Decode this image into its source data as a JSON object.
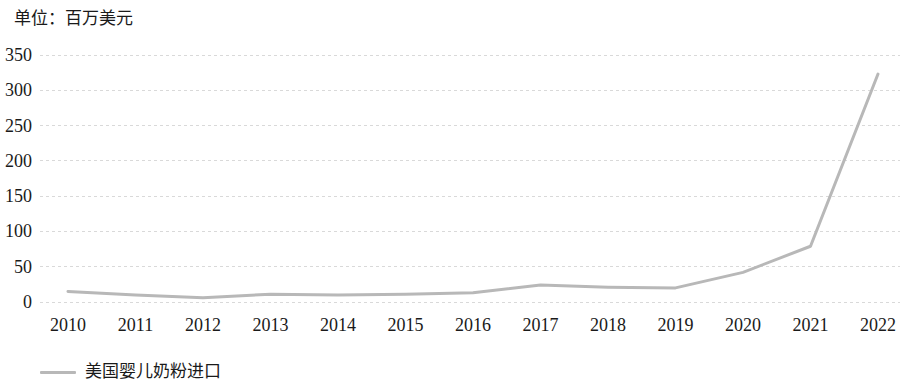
{
  "unit_label": "单位：百万美元",
  "legend": {
    "swatch_color": "#b8b8b8",
    "label": "美国婴儿奶粉进口"
  },
  "axis": {
    "y_ticks": [
      "0",
      "50",
      "100",
      "150",
      "200",
      "250",
      "300",
      "350"
    ],
    "x_ticks": [
      "2010",
      "2011",
      "2012",
      "2013",
      "2014",
      "2015",
      "2016",
      "2017",
      "2018",
      "2019",
      "2020",
      "2021",
      "2022"
    ]
  },
  "chart_data": {
    "type": "line",
    "title": "单位：百万美元",
    "xlabel": "",
    "ylabel": "百万美元",
    "categories": [
      "2010",
      "2011",
      "2012",
      "2013",
      "2014",
      "2015",
      "2016",
      "2017",
      "2018",
      "2019",
      "2020",
      "2021",
      "2022"
    ],
    "series": [
      {
        "name": "美国婴儿奶粉进口",
        "color": "#b8b8b8",
        "values": [
          15,
          10,
          6,
          11,
          10,
          11,
          13,
          24,
          21,
          20,
          42,
          79,
          323
        ]
      }
    ],
    "ylim": [
      0,
      350
    ],
    "ytick_step": 50,
    "grid": true,
    "grid_style": "dotted-horizontal",
    "legend_position": "bottom-left",
    "markers": false
  }
}
